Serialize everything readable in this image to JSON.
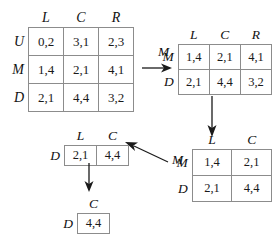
{
  "diagram": {
    "accent_color": "#1a1a1a",
    "border_color": "#8c8c8c"
  },
  "matrices": [
    {
      "id": "matrix-full",
      "name": "original-3x3-payoff-matrix",
      "col_headers": [
        "L",
        "C",
        "R"
      ],
      "row_headers": [
        "U",
        "M",
        "D"
      ],
      "rows": [
        [
          "0,2",
          "3,1",
          "2,3"
        ],
        [
          "1,4",
          "2,1",
          "4,1"
        ],
        [
          "2,1",
          "4,4",
          "3,2"
        ]
      ]
    },
    {
      "id": "matrix-step1",
      "name": "after-eliminating-U-2x3-matrix",
      "col_headers": [
        "L",
        "C",
        "R"
      ],
      "row_headers": [
        "M",
        "D"
      ],
      "rows": [
        [
          "1,4",
          "2,1",
          "4,1"
        ],
        [
          "2,1",
          "4,4",
          "3,2"
        ]
      ]
    },
    {
      "id": "matrix-step2",
      "name": "after-eliminating-R-2x2-matrix",
      "col_headers": [
        "L",
        "C"
      ],
      "row_headers": [
        "M",
        "D"
      ],
      "rows": [
        [
          "1,4",
          "2,1"
        ],
        [
          "2,1",
          "4,4"
        ]
      ]
    },
    {
      "id": "matrix-step3",
      "name": "after-eliminating-M-1x2-matrix",
      "col_headers": [
        "L",
        "C"
      ],
      "row_headers": [
        "D"
      ],
      "rows": [
        [
          "2,1",
          "4,4"
        ]
      ]
    },
    {
      "id": "matrix-step4",
      "name": "final-equilibrium-1x1-matrix",
      "col_headers": [
        "C"
      ],
      "row_headers": [
        "D"
      ],
      "rows": [
        [
          "4,4"
        ]
      ]
    }
  ],
  "arrow_labels": {
    "arrow1": "M",
    "arrow3": "M"
  }
}
